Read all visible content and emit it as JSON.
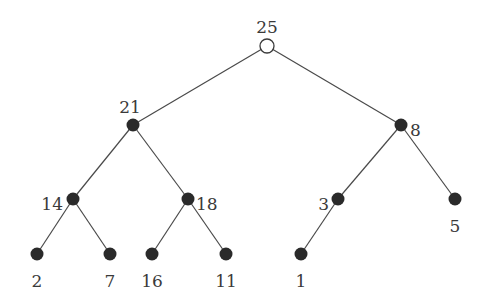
{
  "diagram": {
    "type": "tree",
    "nodes": [
      {
        "id": "n25",
        "label": "25",
        "x": 267,
        "y": 46,
        "style": "open",
        "lx": 267,
        "ly": 28,
        "anchor": "middle"
      },
      {
        "id": "n21",
        "label": "21",
        "x": 133,
        "y": 125,
        "style": "filled",
        "lx": 130,
        "ly": 108,
        "anchor": "middle"
      },
      {
        "id": "n8",
        "label": "8",
        "x": 401,
        "y": 125,
        "style": "filled",
        "lx": 410,
        "ly": 131,
        "anchor": "start"
      },
      {
        "id": "n14",
        "label": "14",
        "x": 73,
        "y": 199,
        "style": "filled",
        "lx": 63,
        "ly": 205,
        "anchor": "end"
      },
      {
        "id": "n18",
        "label": "18",
        "x": 188,
        "y": 199,
        "style": "filled",
        "lx": 196,
        "ly": 205,
        "anchor": "start"
      },
      {
        "id": "n3",
        "label": "3",
        "x": 338,
        "y": 199,
        "style": "filled",
        "lx": 329,
        "ly": 205,
        "anchor": "end"
      },
      {
        "id": "n5",
        "label": "5",
        "x": 455,
        "y": 199,
        "style": "filled",
        "lx": 455,
        "ly": 227,
        "anchor": "middle"
      },
      {
        "id": "n2",
        "label": "2",
        "x": 37,
        "y": 254,
        "style": "filled",
        "lx": 37,
        "ly": 282,
        "anchor": "middle"
      },
      {
        "id": "n7",
        "label": "7",
        "x": 110,
        "y": 254,
        "style": "filled",
        "lx": 110,
        "ly": 282,
        "anchor": "middle"
      },
      {
        "id": "n16",
        "label": "16",
        "x": 152,
        "y": 254,
        "style": "filled",
        "lx": 152,
        "ly": 282,
        "anchor": "middle"
      },
      {
        "id": "n11",
        "label": "11",
        "x": 226,
        "y": 254,
        "style": "filled",
        "lx": 226,
        "ly": 282,
        "anchor": "middle"
      },
      {
        "id": "n1",
        "label": "1",
        "x": 301,
        "y": 254,
        "style": "filled",
        "lx": 301,
        "ly": 282,
        "anchor": "middle"
      }
    ],
    "edges": [
      [
        "n25",
        "n21"
      ],
      [
        "n25",
        "n8"
      ],
      [
        "n21",
        "n14"
      ],
      [
        "n21",
        "n18"
      ],
      [
        "n8",
        "n3"
      ],
      [
        "n8",
        "n5"
      ],
      [
        "n14",
        "n2"
      ],
      [
        "n14",
        "n7"
      ],
      [
        "n18",
        "n16"
      ],
      [
        "n18",
        "n11"
      ],
      [
        "n3",
        "n1"
      ]
    ]
  }
}
